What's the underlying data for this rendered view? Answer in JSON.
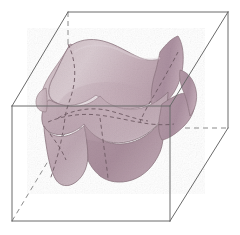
{
  "figure": {
    "title": "Triply periodic minimal surface inside a cubic cell",
    "type": "mathematical-surface-illustration",
    "projection": "oblique-parallel",
    "background_color": "#ffffff",
    "canvas": {
      "width": 240,
      "height": 235
    }
  },
  "cube": {
    "name": "bounding-cube",
    "visible_edge_color": "#6a6a6a",
    "hidden_edge_color": "#8a8a8a",
    "edge_width": 1.0,
    "hidden_dash_pattern": "5,4",
    "vertices": {
      "front_bottom_left": [
        12,
        221
      ],
      "front_bottom_right": [
        170,
        221
      ],
      "front_top_left": [
        12,
        106
      ],
      "front_top_right": [
        170,
        106
      ],
      "back_bottom_left": [
        68,
        128
      ],
      "back_bottom_right": [
        228,
        128
      ],
      "back_top_left": [
        68,
        12
      ],
      "back_top_right": [
        228,
        12
      ]
    },
    "visible_edges": [
      "front_top_left-front_top_right",
      "front_top_right-front_bottom_right",
      "front_bottom_right-front_bottom_left",
      "front_bottom_left-front_top_left",
      "back_top_left-back_top_right",
      "back_top_right-back_bottom_right",
      "front_top_left-back_top_left",
      "front_top_right-back_top_right",
      "front_bottom_right-back_bottom_right"
    ],
    "hidden_edges": [
      "back_bottom_left-back_bottom_right",
      "back_bottom_left-back_top_left",
      "front_bottom_left-back_bottom_left"
    ]
  },
  "surface": {
    "name": "minimal-surface",
    "description": "Saddle-shaped triply periodic minimal surface with four flaring corner lobes and a central notch",
    "fill_light": "#d8c9cf",
    "fill_mid": "#c9b2bb",
    "fill_dark": "#b49aa5",
    "fill_darkest": "#a98f9b",
    "outline_color": "#8d7680",
    "outline_width": 0.8,
    "opacity": 1.0,
    "grid_line_color": "#6e5a63",
    "grid_dash_pattern": "4,3",
    "grid_line_width": 0.9
  },
  "legend": {
    "visible": false,
    "entries": []
  },
  "annotations": []
}
